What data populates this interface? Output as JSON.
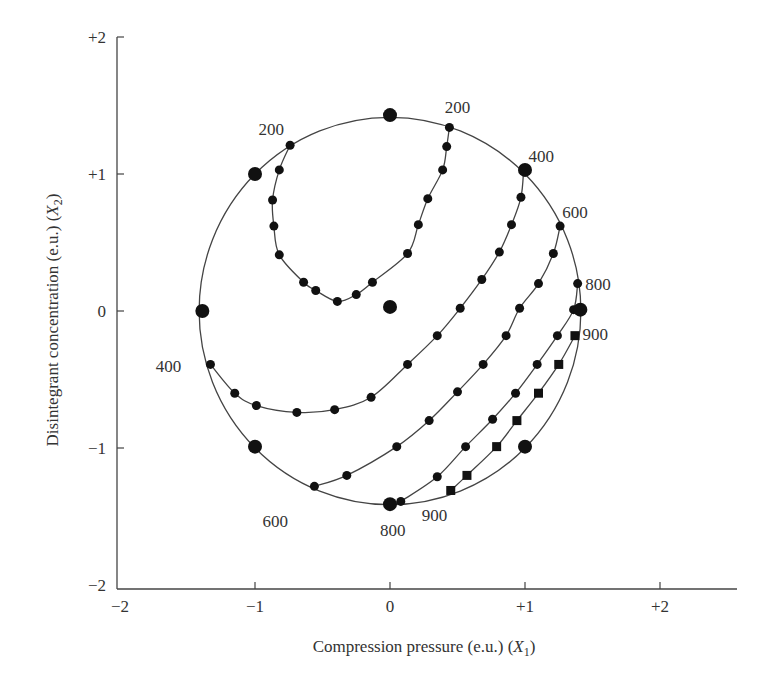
{
  "chart_data": {
    "type": "scatter",
    "title": "",
    "xlabel": "Compression pressure (e.u.) (X1)",
    "ylabel": "Disintegrant concentration (e.u.) (X2)",
    "xlim": [
      -2,
      2.6
    ],
    "ylim": [
      -2,
      2
    ],
    "xticks": [
      {
        "value": -2,
        "label": "−2"
      },
      {
        "value": -1,
        "label": "−1"
      },
      {
        "value": 0,
        "label": "0"
      },
      {
        "value": 1,
        "label": "+1"
      },
      {
        "value": 2,
        "label": "+2"
      }
    ],
    "yticks": [
      {
        "value": 2,
        "label": "+2"
      },
      {
        "value": 1,
        "label": "+1"
      },
      {
        "value": 0,
        "label": "0"
      },
      {
        "value": -1,
        "label": "−1"
      },
      {
        "value": -2,
        "label": "−2"
      }
    ],
    "grid": false,
    "legend": null,
    "design_region": {
      "shape": "circle",
      "center": [
        0,
        0
      ],
      "radius": 1.414
    },
    "design_points": [
      [
        0,
        1.43
      ],
      [
        -1,
        1.0
      ],
      [
        1,
        1.03
      ],
      [
        -1.39,
        0
      ],
      [
        0,
        0.03
      ],
      [
        1.41,
        0.01
      ],
      [
        -1,
        -0.99
      ],
      [
        1,
        -0.99
      ],
      [
        0,
        -1.41
      ]
    ],
    "series": [
      {
        "name": "200",
        "marker": "circle",
        "points": [
          [
            -0.74,
            1.21
          ],
          [
            -0.82,
            1.03
          ],
          [
            -0.87,
            0.81
          ],
          [
            -0.86,
            0.62
          ],
          [
            -0.82,
            0.41
          ],
          [
            -0.64,
            0.21
          ],
          [
            -0.55,
            0.15
          ],
          [
            -0.39,
            0.07
          ],
          [
            -0.25,
            0.12
          ],
          [
            -0.13,
            0.21
          ],
          [
            0.13,
            0.42
          ],
          [
            0.21,
            0.63
          ],
          [
            0.28,
            0.82
          ],
          [
            0.39,
            1.03
          ],
          [
            0.42,
            1.2
          ],
          [
            0.44,
            1.34
          ]
        ],
        "labels": [
          {
            "text": "200",
            "at": [
              -0.88,
              1.33
            ]
          },
          {
            "text": "200",
            "at": [
              0.5,
              1.49
            ]
          }
        ]
      },
      {
        "name": "400",
        "marker": "circle",
        "points": [
          [
            -1.33,
            -0.39
          ],
          [
            -1.15,
            -0.6
          ],
          [
            -0.99,
            -0.69
          ],
          [
            -0.69,
            -0.74
          ],
          [
            -0.41,
            -0.72
          ],
          [
            -0.14,
            -0.63
          ],
          [
            0.13,
            -0.39
          ],
          [
            0.35,
            -0.18
          ],
          [
            0.52,
            0.02
          ],
          [
            0.68,
            0.23
          ],
          [
            0.81,
            0.43
          ],
          [
            0.9,
            0.63
          ],
          [
            0.97,
            0.83
          ],
          [
            0.99,
            1.03
          ]
        ],
        "labels": [
          {
            "text": "400",
            "at": [
              -1.64,
              -0.4
            ]
          },
          {
            "text": "400",
            "at": [
              1.12,
              1.13
            ]
          }
        ]
      },
      {
        "name": "600",
        "marker": "circle",
        "points": [
          [
            -0.56,
            -1.28
          ],
          [
            -0.32,
            -1.2
          ],
          [
            0.05,
            -0.99
          ],
          [
            0.29,
            -0.8
          ],
          [
            0.5,
            -0.59
          ],
          [
            0.69,
            -0.39
          ],
          [
            0.86,
            -0.18
          ],
          [
            0.96,
            0.02
          ],
          [
            1.1,
            0.2
          ],
          [
            1.21,
            0.42
          ],
          [
            1.26,
            0.62
          ]
        ],
        "labels": [
          {
            "text": "600",
            "at": [
              -0.85,
              -1.53
            ]
          },
          {
            "text": "600",
            "at": [
              1.37,
              0.72
            ]
          }
        ]
      },
      {
        "name": "800",
        "marker": "circle",
        "points": [
          [
            0.08,
            -1.39
          ],
          [
            0.35,
            -1.21
          ],
          [
            0.56,
            -0.99
          ],
          [
            0.76,
            -0.79
          ],
          [
            0.93,
            -0.6
          ],
          [
            1.09,
            -0.39
          ],
          [
            1.24,
            -0.18
          ],
          [
            1.36,
            0.01
          ],
          [
            1.39,
            0.2
          ]
        ],
        "labels": [
          {
            "text": "800",
            "at": [
              0.02,
              -1.6
            ]
          },
          {
            "text": "800",
            "at": [
              1.54,
              0.2
            ]
          }
        ]
      },
      {
        "name": "900",
        "marker": "square",
        "points": [
          [
            0.45,
            -1.31
          ],
          [
            0.57,
            -1.2
          ],
          [
            0.79,
            -0.99
          ],
          [
            0.94,
            -0.8
          ],
          [
            1.1,
            -0.6
          ],
          [
            1.25,
            -0.39
          ],
          [
            1.37,
            -0.18
          ]
        ],
        "labels": [
          {
            "text": "900",
            "at": [
              0.33,
              -1.49
            ]
          },
          {
            "text": "900",
            "at": [
              1.52,
              -0.17
            ]
          }
        ]
      }
    ]
  }
}
